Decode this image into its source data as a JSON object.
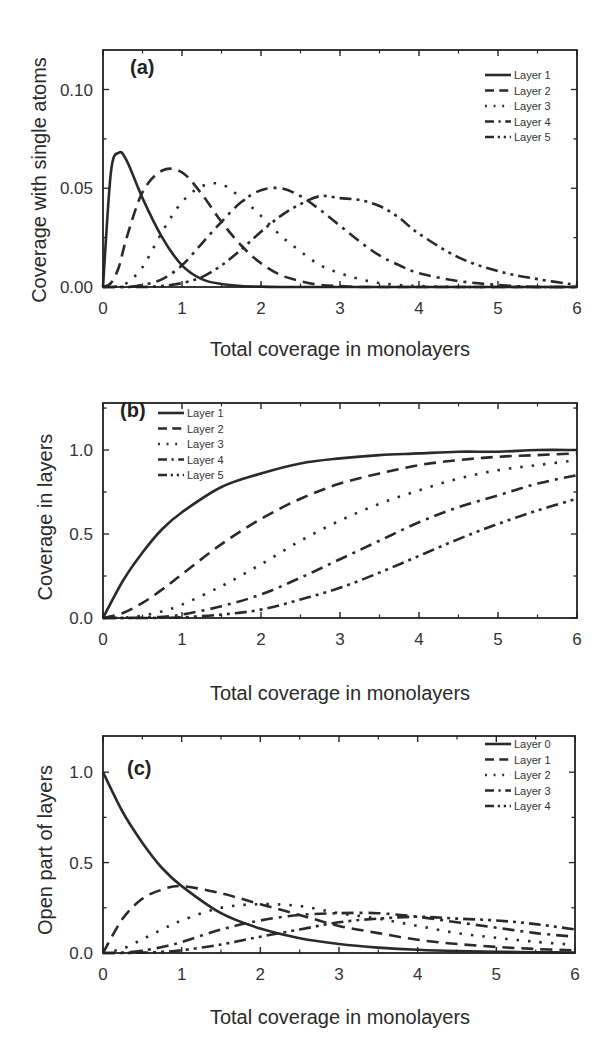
{
  "chart_data": [
    {
      "id": "a",
      "type": "line",
      "panel_label": "(a)",
      "title": "",
      "xlabel": "Total coverage in monolayers",
      "ylabel": "Coverage with single atoms",
      "xlim": [
        0,
        6
      ],
      "ylim": [
        0,
        0.12
      ],
      "xticks": [
        0,
        1,
        2,
        3,
        4,
        5,
        6
      ],
      "xtick_labels": [
        "0",
        "1",
        "2",
        "3",
        "4",
        "5",
        "6"
      ],
      "yticks": [
        0.0,
        0.05,
        0.1
      ],
      "ytick_labels": [
        "0.00",
        "0.05",
        "0.10"
      ],
      "grid": false,
      "legend_position": "upper right",
      "x": [
        0,
        0.1,
        0.2,
        0.3,
        0.5,
        0.75,
        1.0,
        1.25,
        1.5,
        1.75,
        2.0,
        2.25,
        2.5,
        2.75,
        3.0,
        3.25,
        3.5,
        3.75,
        4.0,
        4.5,
        5.0,
        5.5,
        6.0
      ],
      "series": [
        {
          "name": "Layer 1",
          "dash": "solid",
          "values": [
            0,
            0.058,
            0.068,
            0.064,
            0.045,
            0.025,
            0.011,
            0.004,
            0.0015,
            0.0005,
            0.0002,
            0,
            0,
            0,
            0,
            0,
            0,
            0,
            0,
            0,
            0,
            0,
            0
          ]
        },
        {
          "name": "Layer 2",
          "dash": "dash",
          "values": [
            0,
            0.002,
            0.01,
            0.025,
            0.048,
            0.059,
            0.058,
            0.047,
            0.033,
            0.021,
            0.012,
            0.006,
            0.003,
            0.001,
            0.0005,
            0,
            0,
            0,
            0,
            0,
            0,
            0,
            0
          ]
        },
        {
          "name": "Layer 3",
          "dash": "dot",
          "values": [
            0,
            0,
            0.0005,
            0.002,
            0.01,
            0.028,
            0.043,
            0.051,
            0.052,
            0.045,
            0.036,
            0.026,
            0.018,
            0.011,
            0.007,
            0.004,
            0.002,
            0.001,
            0.0005,
            0,
            0,
            0,
            0
          ]
        },
        {
          "name": "Layer 4",
          "dash": "dashdot",
          "values": [
            0,
            0,
            0,
            0,
            0.001,
            0.004,
            0.011,
            0.022,
            0.033,
            0.043,
            0.049,
            0.05,
            0.046,
            0.039,
            0.031,
            0.023,
            0.016,
            0.011,
            0.007,
            0.003,
            0.001,
            0,
            0
          ]
        },
        {
          "name": "Layer 5",
          "dash": "dashdotdot",
          "values": [
            0,
            0,
            0,
            0,
            0,
            0.0005,
            0.002,
            0.005,
            0.011,
            0.019,
            0.028,
            0.036,
            0.042,
            0.046,
            0.045,
            0.044,
            0.041,
            0.035,
            0.027,
            0.015,
            0.008,
            0.004,
            0.001
          ]
        }
      ]
    },
    {
      "id": "b",
      "type": "line",
      "panel_label": "(b)",
      "title": "",
      "xlabel": "Total coverage in monolayers",
      "ylabel": "Coverage in layers",
      "xlim": [
        0,
        6
      ],
      "ylim": [
        0,
        1.28
      ],
      "xticks": [
        0,
        1,
        2,
        3,
        4,
        5,
        6
      ],
      "xtick_labels": [
        "0",
        "1",
        "2",
        "3",
        "4",
        "5",
        "6"
      ],
      "yticks": [
        0.0,
        0.5,
        1.0
      ],
      "ytick_labels": [
        "0.0",
        "0.5",
        "1.0"
      ],
      "grid": false,
      "legend_position": "upper left",
      "x": [
        0,
        0.25,
        0.5,
        0.75,
        1.0,
        1.5,
        2.0,
        2.5,
        3.0,
        3.5,
        4.0,
        4.5,
        5.0,
        5.5,
        6.0
      ],
      "series": [
        {
          "name": "Layer 1",
          "dash": "solid",
          "values": [
            0,
            0.22,
            0.39,
            0.53,
            0.63,
            0.78,
            0.86,
            0.92,
            0.95,
            0.97,
            0.98,
            0.99,
            0.99,
            1.0,
            1.0
          ]
        },
        {
          "name": "Layer 2",
          "dash": "dash",
          "values": [
            0,
            0.03,
            0.09,
            0.17,
            0.26,
            0.44,
            0.59,
            0.71,
            0.8,
            0.86,
            0.91,
            0.94,
            0.96,
            0.97,
            0.98
          ]
        },
        {
          "name": "Layer 3",
          "dash": "dot",
          "values": [
            0,
            0.002,
            0.014,
            0.04,
            0.08,
            0.19,
            0.32,
            0.46,
            0.58,
            0.68,
            0.76,
            0.83,
            0.88,
            0.91,
            0.94
          ]
        },
        {
          "name": "Layer 4",
          "dash": "dashdot",
          "values": [
            0,
            0,
            0.002,
            0.007,
            0.02,
            0.07,
            0.14,
            0.24,
            0.35,
            0.46,
            0.57,
            0.66,
            0.73,
            0.8,
            0.85
          ]
        },
        {
          "name": "Layer 5",
          "dash": "dashdotdot",
          "values": [
            0,
            0,
            0,
            0.001,
            0.004,
            0.02,
            0.05,
            0.11,
            0.18,
            0.27,
            0.37,
            0.47,
            0.56,
            0.64,
            0.71
          ]
        }
      ]
    },
    {
      "id": "c",
      "type": "line",
      "panel_label": "(c)",
      "title": "",
      "xlabel": "Total coverage in monolayers",
      "ylabel": "Open part of layers",
      "xlim": [
        0,
        6
      ],
      "ylim": [
        0,
        1.2
      ],
      "xticks": [
        0,
        1,
        2,
        3,
        4,
        5,
        6
      ],
      "xtick_labels": [
        "0",
        "1",
        "2",
        "3",
        "4",
        "5",
        "6"
      ],
      "yticks": [
        0.0,
        0.5,
        1.0
      ],
      "ytick_labels": [
        "0.0",
        "0.5",
        "1.0"
      ],
      "grid": false,
      "legend_position": "upper right",
      "x": [
        0,
        0.25,
        0.5,
        0.75,
        1.0,
        1.5,
        2.0,
        2.5,
        3.0,
        3.5,
        4.0,
        4.5,
        5.0,
        5.5,
        6.0
      ],
      "series": [
        {
          "name": "Layer 0",
          "dash": "solid",
          "values": [
            1.0,
            0.78,
            0.61,
            0.47,
            0.37,
            0.22,
            0.135,
            0.082,
            0.05,
            0.03,
            0.018,
            0.011,
            0.007,
            0.004,
            0.002
          ]
        },
        {
          "name": "Layer 1",
          "dash": "dash",
          "values": [
            0,
            0.19,
            0.3,
            0.35,
            0.37,
            0.33,
            0.27,
            0.21,
            0.15,
            0.11,
            0.073,
            0.05,
            0.034,
            0.022,
            0.015
          ]
        },
        {
          "name": "Layer 2",
          "dash": "dot",
          "values": [
            0,
            0.024,
            0.076,
            0.13,
            0.18,
            0.25,
            0.27,
            0.26,
            0.22,
            0.19,
            0.15,
            0.11,
            0.084,
            0.062,
            0.045
          ]
        },
        {
          "name": "Layer 3",
          "dash": "dashdot",
          "values": [
            0,
            0.002,
            0.013,
            0.033,
            0.06,
            0.13,
            0.18,
            0.21,
            0.22,
            0.22,
            0.2,
            0.17,
            0.14,
            0.11,
            0.09
          ]
        },
        {
          "name": "Layer 4",
          "dash": "dashdotdot",
          "values": [
            0,
            0,
            0.002,
            0.006,
            0.015,
            0.047,
            0.09,
            0.13,
            0.17,
            0.19,
            0.2,
            0.19,
            0.18,
            0.16,
            0.13
          ]
        }
      ]
    }
  ]
}
